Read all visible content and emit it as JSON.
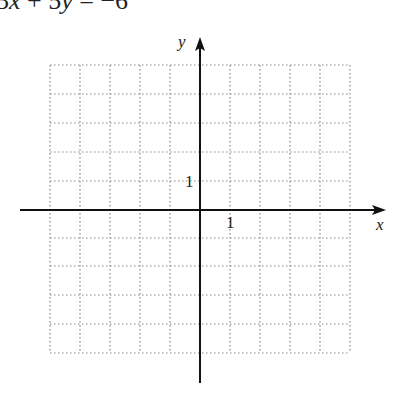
{
  "equation": {
    "prefix": "3",
    "var1": "x",
    "mid": " + 5",
    "var2": "y",
    "suffix": " = −6"
  },
  "axes": {
    "x_label": "x",
    "y_label": "y",
    "x_tick_label": "1",
    "y_tick_label": "1"
  },
  "grid": {
    "x_min": -5,
    "x_max": 5,
    "y_min": -5,
    "y_max": 5,
    "cell_px": 30,
    "style": "dotted"
  },
  "colors": {
    "axis": "#111111",
    "grid": "#888888"
  }
}
